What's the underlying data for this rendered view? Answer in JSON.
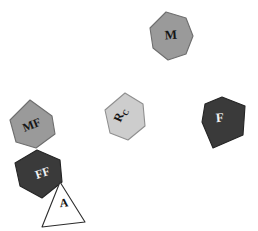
{
  "figure": {
    "background_color": "#ffffff",
    "width": 258,
    "height": 231,
    "type": "scattered-polygon-diagram"
  },
  "palette": {
    "medium_gray": "#9a9a9a",
    "light_gray": "#cdcdcd",
    "dark_gray": "#3a3a3a",
    "white": "#ffffff",
    "outline_dark": "#5a5a5a",
    "outline_black": "#2b2b2b",
    "label_dark": "#161616",
    "label_light": "#f2f2f2"
  },
  "shapes": [
    {
      "id": "piece-m",
      "label": "M",
      "sub": "",
      "fill": "#9a9a9a",
      "stroke": "#6e6e6e",
      "label_color": "#161616",
      "label_size": 13,
      "label_rotation": -4,
      "label_x": 171,
      "label_y": 36,
      "points": "166,12 186,18 193,36 186,54 168,60 153,48 150,28",
      "sides": 7
    },
    {
      "id": "piece-mf",
      "label": "MF",
      "sub": "",
      "fill": "#9a9a9a",
      "stroke": "#6e6e6e",
      "label_color": "#161616",
      "label_size": 12,
      "label_rotation": -22,
      "label_x": 32,
      "label_y": 126,
      "points": "30,100 52,116 55,134 36,148 16,142 10,120"
    },
    {
      "id": "piece-ff",
      "label": "FF",
      "sub": "",
      "fill": "#3a3a3a",
      "stroke": "#242424",
      "label_color": "#f2f2f2",
      "label_size": 12,
      "label_rotation": -18,
      "label_x": 43,
      "label_y": 174,
      "points": "37,150 60,160 62,182 42,198 20,186 15,163"
    },
    {
      "id": "piece-a",
      "label": "A",
      "sub": "",
      "fill": "#ffffff",
      "stroke": "#2b2b2b",
      "label_color": "#161616",
      "label_size": 12,
      "label_rotation": -6,
      "label_x": 64,
      "label_y": 204,
      "points": "60,182 85,222 42,227"
    },
    {
      "id": "piece-rc",
      "label": "R",
      "sub": "C",
      "fill": "#cdcdcd",
      "stroke": "#8f8f8f",
      "label_color": "#161616",
      "label_size": 12,
      "label_rotation": -66,
      "label_x": 121,
      "label_y": 115,
      "points": "125,93 143,104 145,126 128,140 110,133 105,110"
    },
    {
      "id": "piece-f",
      "label": "F",
      "sub": "",
      "fill": "#3a3a3a",
      "stroke": "#242424",
      "label_color": "#f2f2f2",
      "label_size": 13,
      "label_rotation": -5,
      "label_x": 220,
      "label_y": 119,
      "points": "222,97 245,106 243,135 213,148 202,122 205,104"
    }
  ]
}
